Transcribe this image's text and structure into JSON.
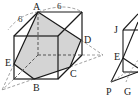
{
  "figure": {
    "type": "cube cross-section diagram",
    "colors": {
      "stroke": "#1a1a1a",
      "shade": "#d4d4d4",
      "dashed": "#777777"
    },
    "labels": {
      "A": "A",
      "B": "B",
      "C": "C",
      "D": "D",
      "E": "E",
      "J": "J",
      "E2": "E",
      "P": "P",
      "G": "G"
    },
    "dimensions": {
      "left_edge": "6",
      "top_edge": "6"
    }
  }
}
